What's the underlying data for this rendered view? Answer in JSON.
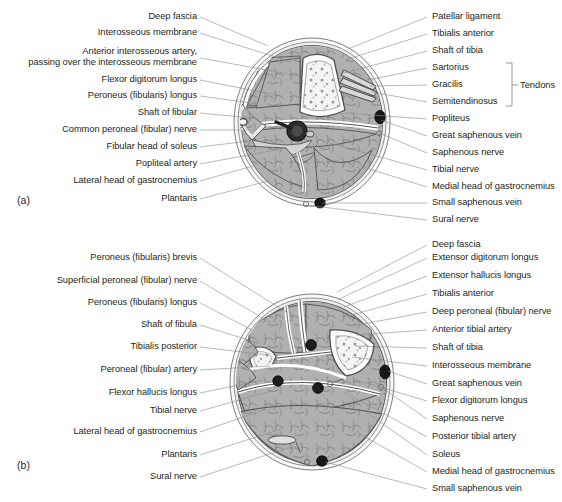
{
  "figure": {
    "panels": [
      {
        "id": "a",
        "letter": "(a)",
        "left_labels": [
          {
            "text": "Deep fascia",
            "y": 17,
            "anchor_x": 197,
            "tx": 268,
            "ty": 46
          },
          {
            "text": "Interosseous membrane",
            "y": 33,
            "anchor_x": 197,
            "tx": 291,
            "ty": 62
          },
          {
            "text": "Anterior interosseous artery,",
            "y": 52,
            "anchor_x": 197,
            "tx": 300,
            "ty": 76,
            "line2": "passing over the interosseous membrane",
            "y2": 63
          },
          {
            "text": "Flexor digitorum longus",
            "y": 80,
            "anchor_x": 197,
            "tx": 281,
            "ty": 96
          },
          {
            "text": "Peroneus (fibularis) longus",
            "y": 96,
            "anchor_x": 197,
            "tx": 258,
            "ty": 104
          },
          {
            "text": "Shaft of fibular",
            "y": 113,
            "anchor_x": 197,
            "tx": 252,
            "ty": 118
          },
          {
            "text": "Common peroneal (fibular) nerve",
            "y": 130,
            "anchor_x": 197,
            "tx": 247,
            "ty": 130
          },
          {
            "text": "Fibular head of soleus",
            "y": 147,
            "anchor_x": 197,
            "tx": 249,
            "ty": 141
          },
          {
            "text": "Popliteal artery",
            "y": 164,
            "anchor_x": 197,
            "tx": 281,
            "ty": 149
          },
          {
            "text": "Lateral head of gastrocnemius",
            "y": 181,
            "anchor_x": 197,
            "tx": 253,
            "ty": 166
          },
          {
            "text": "Plantaris",
            "y": 199,
            "anchor_x": 197,
            "tx": 268,
            "ty": 181
          }
        ],
        "right_labels": [
          {
            "text": "Patellar ligament",
            "y": 17,
            "anchor_x": 430,
            "tx": 348,
            "ty": 49
          },
          {
            "text": "Tibialis anterior",
            "y": 34,
            "anchor_x": 430,
            "tx": 345,
            "ty": 60
          },
          {
            "text": "Shaft of tibia",
            "y": 51,
            "anchor_x": 430,
            "tx": 340,
            "ty": 74
          },
          {
            "text": "Sartorius",
            "y": 68,
            "anchor_x": 430,
            "tx": 368,
            "ty": 80
          },
          {
            "text": "Gracilis",
            "y": 85,
            "anchor_x": 430,
            "tx": 370,
            "ty": 86
          },
          {
            "text": "Semitendinosus",
            "y": 102,
            "anchor_x": 430,
            "tx": 372,
            "ty": 92
          },
          {
            "text": "Popliteus",
            "y": 119,
            "anchor_x": 430,
            "tx": 345,
            "ty": 113
          },
          {
            "text": "Great saphenous vein",
            "y": 136,
            "anchor_x": 430,
            "tx": 381,
            "ty": 120
          },
          {
            "text": "Saphenous nerve",
            "y": 153,
            "anchor_x": 430,
            "tx": 379,
            "ty": 133
          },
          {
            "text": "Tibial nerve",
            "y": 170,
            "anchor_x": 430,
            "tx": 330,
            "ty": 143
          },
          {
            "text": "Medial head of gastrocnemius",
            "y": 187,
            "anchor_x": 430,
            "tx": 360,
            "ty": 166
          },
          {
            "text": "Small saphenous vein",
            "y": 203,
            "anchor_x": 430,
            "tx": 322,
            "ty": 202
          },
          {
            "text": "Sural nerve",
            "y": 220,
            "anchor_x": 430,
            "tx": 309,
            "ty": 204
          }
        ],
        "bracket": {
          "label": "Tendons",
          "items": [
            "Sartorius",
            "Gracilis",
            "Semitendinosus"
          ],
          "x": 506,
          "y_top": 63,
          "y_bottom": 106,
          "label_x": 513,
          "label_y": 85
        }
      },
      {
        "id": "b",
        "letter": "(b)",
        "left_labels": [
          {
            "text": "Peroneus (fibularis) brevis",
            "y": 258,
            "anchor_x": 197,
            "tx": 286,
            "ty": 312
          },
          {
            "text": "Superficial peroneal (fibular) nerve",
            "y": 281,
            "anchor_x": 197,
            "tx": 271,
            "ty": 323
          },
          {
            "text": "Peroneus (fibularis) longus",
            "y": 303,
            "anchor_x": 197,
            "tx": 252,
            "ty": 330
          },
          {
            "text": "Shaft of fibula",
            "y": 325,
            "anchor_x": 197,
            "tx": 258,
            "ty": 343
          },
          {
            "text": "Tibialis posterior",
            "y": 347,
            "anchor_x": 197,
            "tx": 268,
            "ty": 355
          },
          {
            "text": "Peroneal (fibular) artery",
            "y": 370,
            "anchor_x": 197,
            "tx": 270,
            "ty": 366
          },
          {
            "text": "Flexor hallucis longus",
            "y": 393,
            "anchor_x": 197,
            "tx": 263,
            "ty": 380
          },
          {
            "text": "Tibial nerve",
            "y": 411,
            "anchor_x": 197,
            "tx": 272,
            "ty": 391
          },
          {
            "text": "Lateral head of gastrocnemius",
            "y": 432,
            "anchor_x": 197,
            "tx": 266,
            "ty": 409
          },
          {
            "text": "Plantaris",
            "y": 455,
            "anchor_x": 197,
            "tx": 281,
            "ty": 429
          },
          {
            "text": "Sural nerve",
            "y": 477,
            "anchor_x": 197,
            "tx": 291,
            "ty": 447
          }
        ],
        "right_labels": [
          {
            "text": "Deep fascia",
            "y": 245,
            "anchor_x": 430,
            "tx": 337,
            "ty": 290
          },
          {
            "text": "Extensor digitorum longus",
            "y": 258,
            "anchor_x": 430,
            "tx": 339,
            "ty": 297
          },
          {
            "text": "Extensor hallucis longus",
            "y": 276,
            "anchor_x": 430,
            "tx": 344,
            "ty": 305
          },
          {
            "text": "Tibialis anterior",
            "y": 294,
            "anchor_x": 430,
            "tx": 348,
            "ty": 314
          },
          {
            "text": "Deep peroneal (fibular) nerve",
            "y": 312,
            "anchor_x": 430,
            "tx": 352,
            "ty": 324
          },
          {
            "text": "Anterior tibial artery",
            "y": 330,
            "anchor_x": 430,
            "tx": 356,
            "ty": 333
          },
          {
            "text": "Shaft of tibia",
            "y": 348,
            "anchor_x": 430,
            "tx": 355,
            "ty": 344
          },
          {
            "text": "Interosseous membrane",
            "y": 366,
            "anchor_x": 430,
            "tx": 352,
            "ty": 355
          },
          {
            "text": "Great saphenous vein",
            "y": 384,
            "anchor_x": 430,
            "tx": 384,
            "ty": 369
          },
          {
            "text": "Flexor digitorum longus",
            "y": 401,
            "anchor_x": 430,
            "tx": 353,
            "ty": 377
          },
          {
            "text": "Saphenous nerve",
            "y": 419,
            "anchor_x": 430,
            "tx": 379,
            "ty": 386
          },
          {
            "text": "Posterior tibial artery",
            "y": 437,
            "anchor_x": 430,
            "tx": 344,
            "ty": 390
          },
          {
            "text": "Soleus",
            "y": 455,
            "anchor_x": 430,
            "tx": 366,
            "ty": 410
          },
          {
            "text": "Medial head of gastrocnemius",
            "y": 472,
            "anchor_x": 430,
            "tx": 360,
            "ty": 432
          },
          {
            "text": "Small saphenous vein",
            "y": 489,
            "anchor_x": 430,
            "tx": 323,
            "ty": 461
          }
        ]
      }
    ]
  },
  "colors": {
    "leader_line": "#8a8a8a",
    "text": "#231f20",
    "muscle_fill": "#b3b3b3",
    "fascia_fill": "#e8e8e8",
    "bone_fill": "#f2f2f2",
    "vessel_dark": "#1a1a1a",
    "outline": "#4d4d4d",
    "background": "#ffffff"
  }
}
